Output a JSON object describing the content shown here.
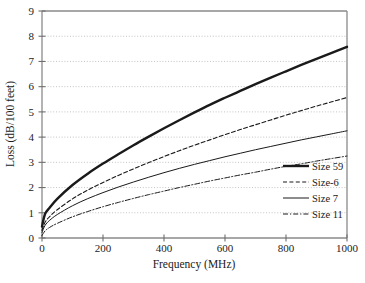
{
  "chart_data": {
    "type": "line",
    "title": "",
    "xlabel": "Frequency (MHz)",
    "ylabel": "Loss (dB/100 feet)",
    "xlim": [
      0,
      1000
    ],
    "ylim": [
      0,
      9
    ],
    "grid": true,
    "grid_axis": "y",
    "legend_position": "bottom-right",
    "xticks": [
      0,
      200,
      400,
      600,
      800,
      1000
    ],
    "yticks": [
      0,
      1,
      2,
      3,
      4,
      5,
      6,
      7,
      8,
      9
    ],
    "xtick_labels": [
      "0",
      "200",
      "400",
      "600",
      "800",
      "1000"
    ],
    "ytick_labels": [
      "0",
      "1",
      "2",
      "3",
      "4",
      "5",
      "6",
      "7",
      "8",
      "9"
    ],
    "x": [
      0,
      10,
      25,
      50,
      100,
      150,
      200,
      250,
      300,
      350,
      400,
      450,
      500,
      550,
      600,
      650,
      700,
      750,
      800,
      850,
      900,
      950,
      1000
    ],
    "series": [
      {
        "name": "Size 59",
        "style": "solid-thick",
        "color": "#1a1a1a",
        "width": 2.4,
        "values": [
          0.45,
          0.95,
          1.2,
          1.55,
          2.1,
          2.55,
          2.95,
          3.32,
          3.68,
          4.02,
          4.35,
          4.67,
          4.98,
          5.28,
          5.56,
          5.83,
          6.1,
          6.36,
          6.61,
          6.86,
          7.1,
          7.34,
          7.58
        ]
      },
      {
        "name": "Size-6",
        "style": "dashed",
        "color": "#1a1a1a",
        "width": 1.1,
        "values": [
          0.3,
          0.62,
          0.85,
          1.12,
          1.55,
          1.9,
          2.2,
          2.48,
          2.74,
          2.99,
          3.23,
          3.46,
          3.68,
          3.89,
          4.1,
          4.3,
          4.49,
          4.68,
          4.87,
          5.05,
          5.23,
          5.4,
          5.57
        ]
      },
      {
        "name": "Size 7",
        "style": "solid-thin",
        "color": "#1a1a1a",
        "width": 1.0,
        "values": [
          0.22,
          0.5,
          0.7,
          0.93,
          1.28,
          1.56,
          1.8,
          2.02,
          2.22,
          2.41,
          2.59,
          2.76,
          2.92,
          3.07,
          3.22,
          3.36,
          3.5,
          3.63,
          3.76,
          3.89,
          4.01,
          4.13,
          4.25
        ]
      },
      {
        "name": "Size 11",
        "style": "dash-dot",
        "color": "#1a1a1a",
        "width": 1.0,
        "values": [
          0.1,
          0.28,
          0.42,
          0.58,
          0.84,
          1.05,
          1.24,
          1.41,
          1.57,
          1.72,
          1.86,
          2.0,
          2.13,
          2.26,
          2.38,
          2.5,
          2.61,
          2.73,
          2.84,
          2.94,
          3.05,
          3.15,
          3.25
        ]
      }
    ],
    "series_endpoint_values_at_1000MHz": [
      8.0,
      6.5,
      5.28,
      4.3
    ],
    "axis_color": "#808080",
    "grid_color": "#aaaaaa",
    "background": "#ffffff"
  },
  "legend": {
    "items": [
      {
        "label": "Size 59"
      },
      {
        "label": "Size-6"
      },
      {
        "label": "Size 7"
      },
      {
        "label": "Size 11"
      }
    ]
  }
}
